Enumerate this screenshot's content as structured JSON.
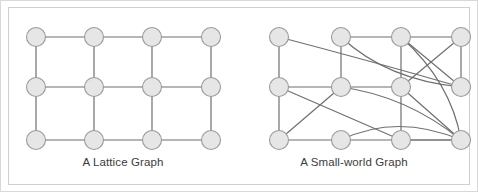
{
  "figure": {
    "background_color": "#ffffff",
    "frame_color": "#d8d8d8",
    "panel_border_color": "#cfcfcf",
    "node_fill_color": "#e6e6e6",
    "node_stroke_color": "#9a9a9a",
    "edge_color": "#6f6f6f",
    "caption_color": "#3b3b3b"
  },
  "panels": [
    {
      "id": "lattice",
      "caption": "A Lattice Graph",
      "node_radius": 9.5,
      "nodes": [
        {
          "id": "L00",
          "x": 27,
          "y": 29
        },
        {
          "id": "L01",
          "x": 85,
          "y": 29
        },
        {
          "id": "L02",
          "x": 143,
          "y": 29
        },
        {
          "id": "L03",
          "x": 202,
          "y": 29
        },
        {
          "id": "L10",
          "x": 27,
          "y": 79
        },
        {
          "id": "L11",
          "x": 85,
          "y": 79
        },
        {
          "id": "L12",
          "x": 143,
          "y": 79
        },
        {
          "id": "L13",
          "x": 202,
          "y": 79
        },
        {
          "id": "L20",
          "x": 27,
          "y": 132
        },
        {
          "id": "L21",
          "x": 85,
          "y": 132
        },
        {
          "id": "L22",
          "x": 143,
          "y": 132
        },
        {
          "id": "L23",
          "x": 202,
          "y": 132
        }
      ],
      "edges": [
        {
          "from": "L00",
          "to": "L01",
          "type": "line"
        },
        {
          "from": "L01",
          "to": "L02",
          "type": "line"
        },
        {
          "from": "L02",
          "to": "L03",
          "type": "line"
        },
        {
          "from": "L10",
          "to": "L11",
          "type": "line"
        },
        {
          "from": "L11",
          "to": "L12",
          "type": "line"
        },
        {
          "from": "L12",
          "to": "L13",
          "type": "line"
        },
        {
          "from": "L20",
          "to": "L21",
          "type": "line"
        },
        {
          "from": "L21",
          "to": "L22",
          "type": "line"
        },
        {
          "from": "L22",
          "to": "L23",
          "type": "line"
        },
        {
          "from": "L00",
          "to": "L10",
          "type": "line"
        },
        {
          "from": "L10",
          "to": "L20",
          "type": "line"
        },
        {
          "from": "L01",
          "to": "L11",
          "type": "line"
        },
        {
          "from": "L11",
          "to": "L21",
          "type": "line"
        },
        {
          "from": "L02",
          "to": "L12",
          "type": "line"
        },
        {
          "from": "L12",
          "to": "L22",
          "type": "line"
        },
        {
          "from": "L03",
          "to": "L13",
          "type": "line"
        },
        {
          "from": "L13",
          "to": "L23",
          "type": "line"
        }
      ]
    },
    {
      "id": "smallworld",
      "caption": "A Small-world Graph",
      "node_radius": 9.5,
      "nodes": [
        {
          "id": "S00",
          "x": 42,
          "y": 29
        },
        {
          "id": "S01",
          "x": 104,
          "y": 29
        },
        {
          "id": "S02",
          "x": 164,
          "y": 29
        },
        {
          "id": "S03",
          "x": 224,
          "y": 29
        },
        {
          "id": "S10",
          "x": 42,
          "y": 79
        },
        {
          "id": "S11",
          "x": 104,
          "y": 79
        },
        {
          "id": "S12",
          "x": 164,
          "y": 79
        },
        {
          "id": "S13",
          "x": 224,
          "y": 79
        },
        {
          "id": "S20",
          "x": 42,
          "y": 132
        },
        {
          "id": "S21",
          "x": 104,
          "y": 132
        },
        {
          "id": "S22",
          "x": 164,
          "y": 132
        },
        {
          "id": "S23",
          "x": 224,
          "y": 132
        }
      ],
      "edges": [
        {
          "from": "S01",
          "to": "S02",
          "type": "line"
        },
        {
          "from": "S02",
          "to": "S03",
          "type": "line"
        },
        {
          "from": "S10",
          "to": "S11",
          "type": "line"
        },
        {
          "from": "S11",
          "to": "S12",
          "type": "line"
        },
        {
          "from": "S20",
          "to": "S21",
          "type": "line"
        },
        {
          "from": "S21",
          "to": "S22",
          "type": "line"
        },
        {
          "from": "S22",
          "to": "S23",
          "type": "line"
        },
        {
          "from": "S00",
          "to": "S10",
          "type": "line"
        },
        {
          "from": "S10",
          "to": "S20",
          "type": "line"
        },
        {
          "from": "S01",
          "to": "S11",
          "type": "line"
        },
        {
          "from": "S02",
          "to": "S12",
          "type": "line"
        },
        {
          "from": "S12",
          "to": "S22",
          "type": "line"
        },
        {
          "from": "S03",
          "to": "S13",
          "type": "line"
        },
        {
          "from": "S02",
          "to": "S13",
          "type": "line"
        },
        {
          "from": "S10",
          "to": "S22",
          "type": "line"
        },
        {
          "from": "S20",
          "to": "S11",
          "type": "line"
        },
        {
          "from": "S12",
          "to": "S23",
          "type": "line"
        },
        {
          "from": "S03",
          "to": "S12",
          "type": "line"
        },
        {
          "from": "S22",
          "to": "S23",
          "type": "line"
        },
        {
          "from": "S00",
          "to": "S13",
          "type": "curve",
          "cx": 130,
          "cy": 52
        },
        {
          "from": "S01",
          "to": "S13",
          "type": "curve",
          "cx": 150,
          "cy": 72
        },
        {
          "from": "S11",
          "to": "S23",
          "type": "curve",
          "cx": 170,
          "cy": 88
        },
        {
          "from": "S21",
          "to": "S23",
          "type": "curve",
          "cx": 160,
          "cy": 105
        },
        {
          "from": "S02",
          "to": "S23",
          "type": "curve",
          "cx": 214,
          "cy": 74
        }
      ]
    }
  ]
}
